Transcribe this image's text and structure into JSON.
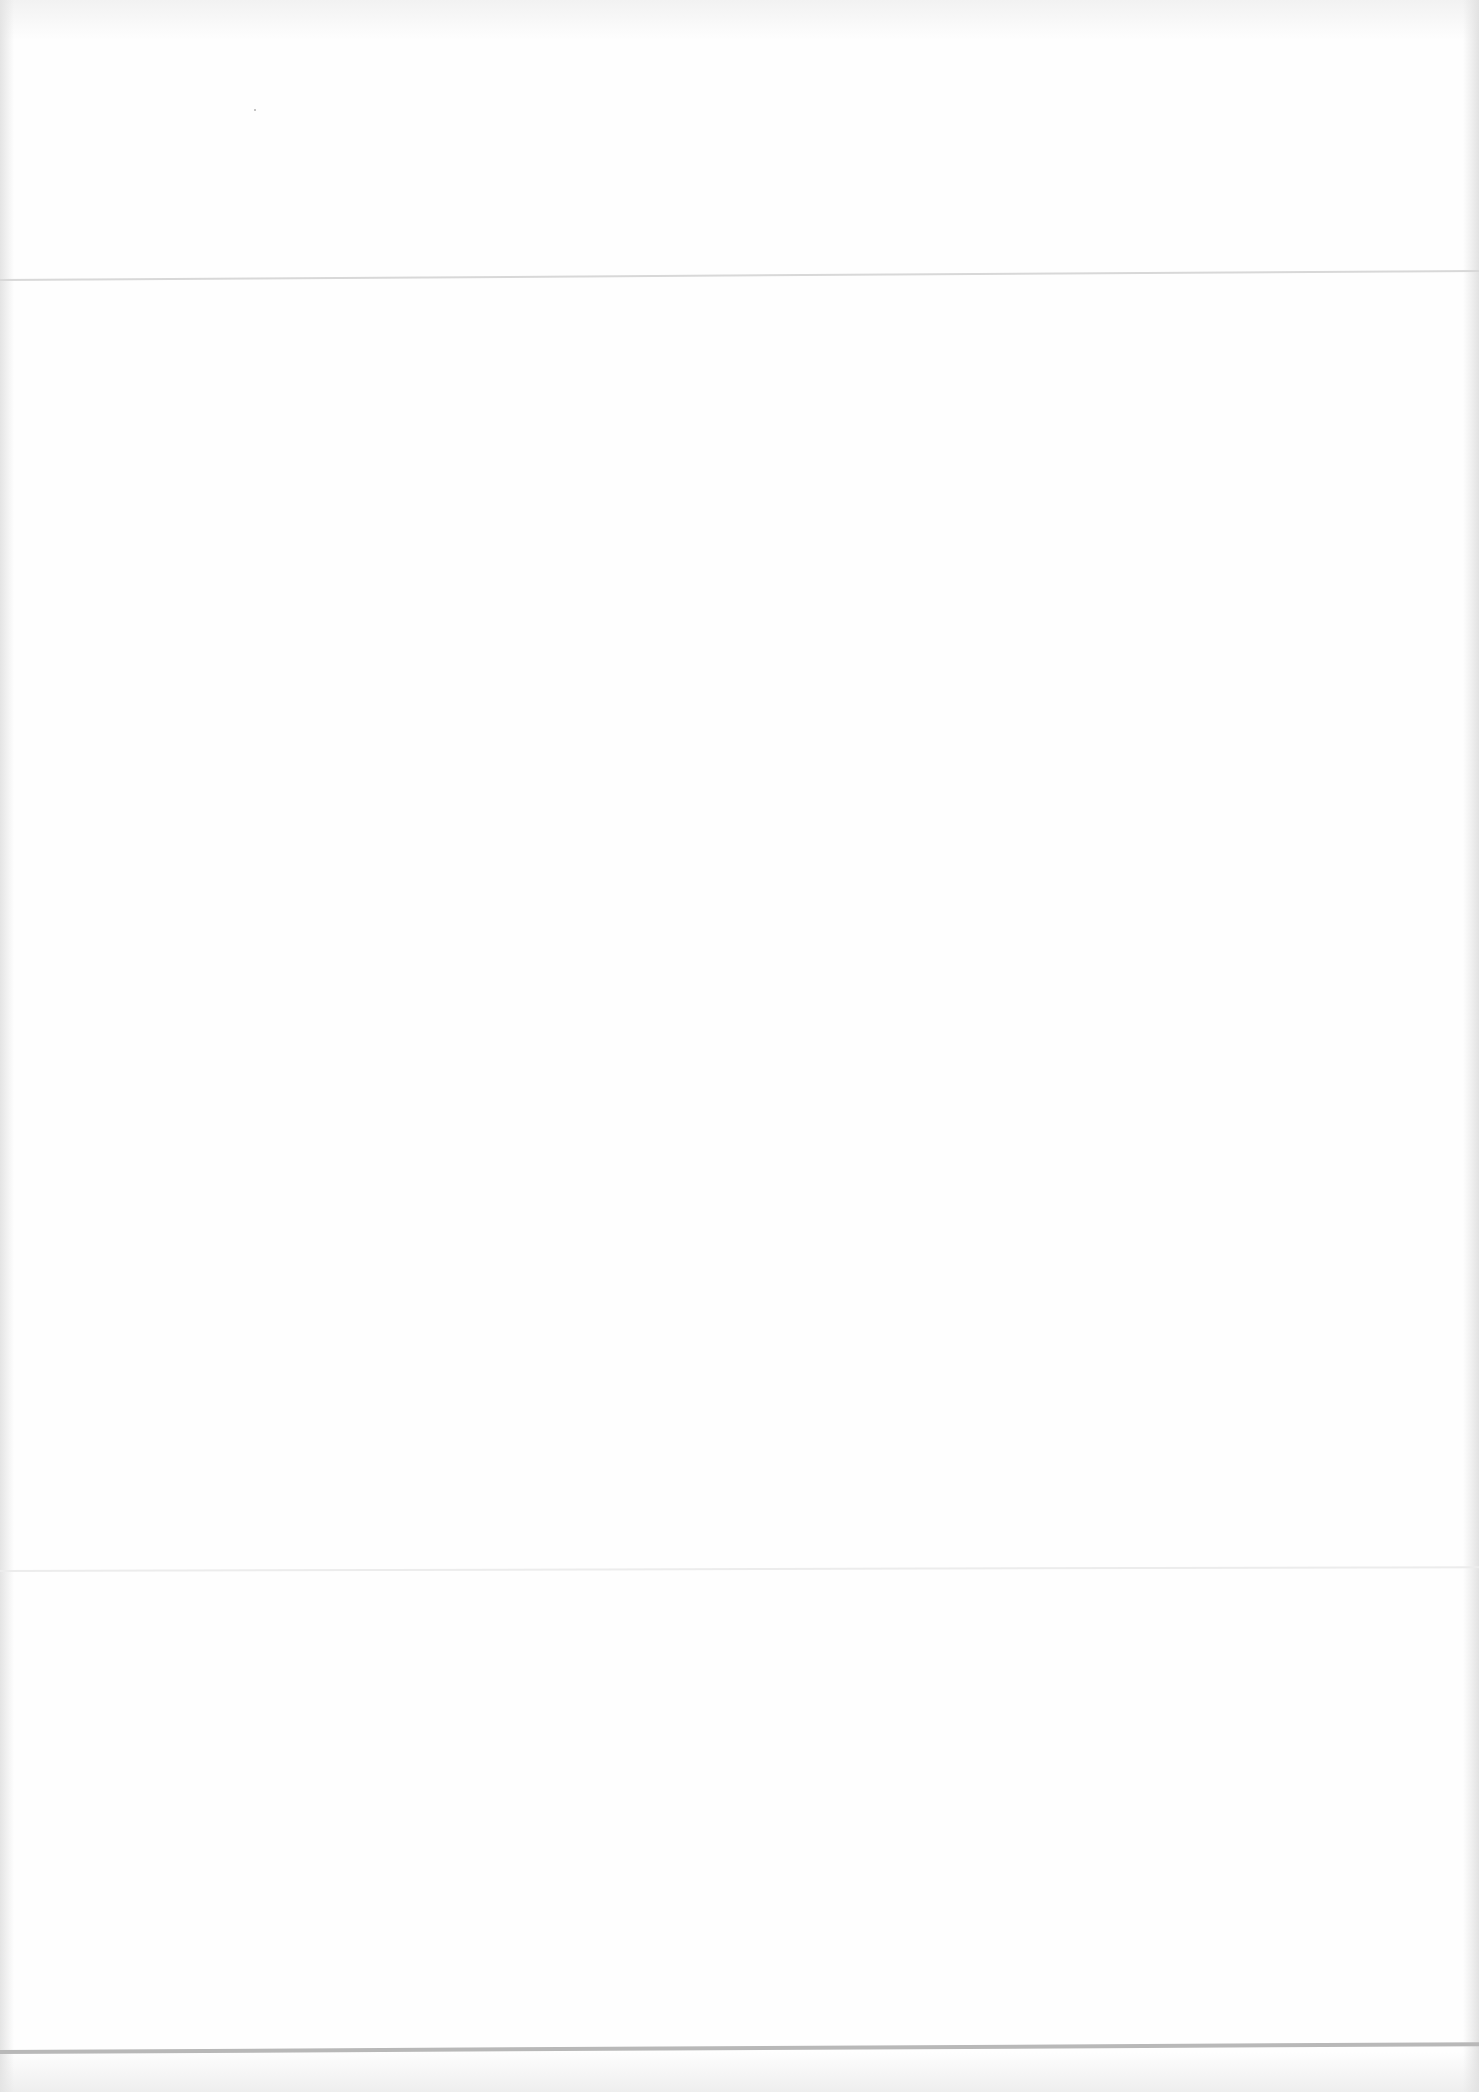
{
  "page": {
    "type": "blank-scanned-page",
    "text": "",
    "colors": {
      "paper": "#fefefe",
      "fold_line": "#d8d8d8",
      "bottom_line": "#b8b8b8"
    }
  }
}
